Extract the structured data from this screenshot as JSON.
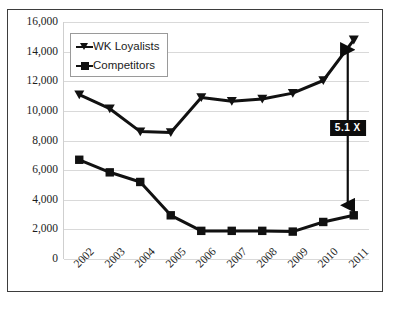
{
  "chart_data": {
    "type": "line",
    "title": "",
    "xlabel": "",
    "ylabel": "",
    "grid": true,
    "legend_position": "top-left",
    "ylim": [
      0,
      16000
    ],
    "ytick_labels": [
      "16,000",
      "14,000",
      "12,000",
      "10,000",
      "8,000",
      "6,000",
      "4,000",
      "2,000",
      "0"
    ],
    "ytick_values": [
      16000,
      14000,
      12000,
      10000,
      8000,
      6000,
      4000,
      2000,
      0
    ],
    "categories": [
      "2002",
      "2003",
      "2004",
      "2005",
      "2006",
      "2007",
      "2008",
      "2009",
      "2010",
      "2011"
    ],
    "series": [
      {
        "name": "WK Loyalists",
        "marker": "triangle",
        "color": "#111111",
        "values": [
          11100,
          10150,
          8600,
          8550,
          10900,
          10650,
          10800,
          11200,
          12050,
          14800
        ]
      },
      {
        "name": "Competitors",
        "marker": "square",
        "color": "#111111",
        "values": [
          6700,
          5850,
          5200,
          2950,
          1900,
          1900,
          1900,
          1850,
          2500,
          2950
        ]
      }
    ],
    "annotations": [
      {
        "label": "5.1 X",
        "kind": "double-arrow",
        "at_category": "2011",
        "from_value": 2950,
        "to_value": 14800,
        "text_color": "#ffffff",
        "box_color": "#0d0d0d"
      }
    ]
  }
}
